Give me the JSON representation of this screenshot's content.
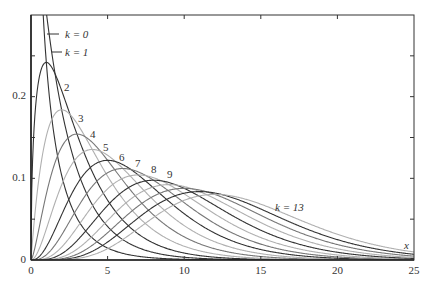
{
  "chart_data": {
    "type": "line",
    "title": "",
    "xlabel": "x",
    "ylabel": "",
    "xlim": [
      0,
      25
    ],
    "ylim": [
      0,
      0.3
    ],
    "grid": false,
    "legend": "inline labels",
    "x_ticks": [
      0,
      5,
      10,
      15,
      20,
      25
    ],
    "x_tick_labels": [
      "0",
      "5",
      "10",
      "15",
      "20",
      "25"
    ],
    "y_ticks": [
      0,
      0.05,
      0.1,
      0.15,
      0.2,
      0.25
    ],
    "y_tick_labels": [
      "0",
      "",
      "0.1",
      "",
      "0.2",
      ""
    ],
    "series": [
      {
        "name": "k = 0",
        "k": 0,
        "dof": 1,
        "peak_x": 0,
        "peak_y": "off-scale"
      },
      {
        "name": "k = 1",
        "k": 1,
        "dof": 2,
        "peak_x": 0,
        "peak_y": 0.5
      },
      {
        "name": "2",
        "k": 2,
        "dof": 3,
        "peak_x": 1,
        "peak_y": 0.242
      },
      {
        "name": "3",
        "k": 3,
        "dof": 4,
        "peak_x": 2,
        "peak_y": 0.184
      },
      {
        "name": "4",
        "k": 4,
        "dof": 5,
        "peak_x": 3,
        "peak_y": 0.154
      },
      {
        "name": "5",
        "k": 5,
        "dof": 6,
        "peak_x": 4,
        "peak_y": 0.135
      },
      {
        "name": "6",
        "k": 6,
        "dof": 7,
        "peak_x": 5,
        "peak_y": 0.122
      },
      {
        "name": "7",
        "k": 7,
        "dof": 8,
        "peak_x": 6,
        "peak_y": 0.112
      },
      {
        "name": "8",
        "k": 8,
        "dof": 9,
        "peak_x": 7,
        "peak_y": 0.104
      },
      {
        "name": "9",
        "k": 9,
        "dof": 10,
        "peak_x": 8,
        "peak_y": 0.098
      },
      {
        "name": "",
        "k": 10,
        "dof": 11,
        "peak_x": 9,
        "peak_y": 0.093
      },
      {
        "name": "",
        "k": 11,
        "dof": 12,
        "peak_x": 10,
        "peak_y": 0.088
      },
      {
        "name": "",
        "k": 12,
        "dof": 13,
        "peak_x": 11,
        "peak_y": 0.085
      },
      {
        "name": "k = 13",
        "k": 13,
        "dof": 14,
        "peak_x": 12,
        "peak_y": 0.082
      }
    ],
    "annotations": [
      {
        "text": "k = 0",
        "x": 2.2,
        "y": 0.275
      },
      {
        "text": "k = 1",
        "x": 2.2,
        "y": 0.253
      },
      {
        "text": "2",
        "x": 2.3,
        "y": 0.21
      },
      {
        "text": "3",
        "x": 3.2,
        "y": 0.172
      },
      {
        "text": "4",
        "x": 4.0,
        "y": 0.153
      },
      {
        "text": "5",
        "x": 4.9,
        "y": 0.137
      },
      {
        "text": "6",
        "x": 5.9,
        "y": 0.125
      },
      {
        "text": "7",
        "x": 7.0,
        "y": 0.117
      },
      {
        "text": "8",
        "x": 8.0,
        "y": 0.11
      },
      {
        "text": "9",
        "x": 9.1,
        "y": 0.104
      },
      {
        "text": "k = 13",
        "x": 16.0,
        "y": 0.065
      }
    ]
  },
  "labels": {
    "x_axis": "x",
    "k0": "k = 0",
    "k1": "k = 1",
    "n2": "2",
    "n3": "3",
    "n4": "4",
    "n5": "5",
    "n6": "6",
    "n7": "7",
    "n8": "8",
    "n9": "9",
    "k13": "k = 13",
    "xt0": "0",
    "xt5": "5",
    "xt10": "10",
    "xt15": "15",
    "xt20": "20",
    "xt25": "25",
    "yt0": "0",
    "yt01": "0.1",
    "yt02": "0.2"
  },
  "colors": {
    "axis": "#222222",
    "dark": "#333333",
    "mid": "#777777",
    "light": "#b0b0b0"
  }
}
